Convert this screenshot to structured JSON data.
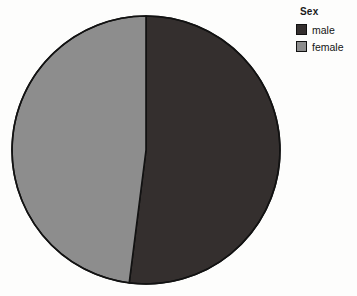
{
  "chart_data": {
    "type": "pie",
    "title": "",
    "legend_title": "Sex",
    "legend_position": "top-right",
    "categories": [
      "male",
      "female"
    ],
    "values": [
      52,
      48
    ],
    "value_unit": "percent",
    "colors": [
      "#342F2E",
      "#8D8D8D"
    ],
    "slice_border_color": "#121212",
    "start_angle_deg": 0,
    "direction": "clockwise",
    "background": "#FDFDFC",
    "grid": false,
    "labels_shown": false,
    "series": [
      {
        "name": "Sex",
        "slices": [
          {
            "label": "male",
            "value": 52,
            "color": "#342F2E",
            "angle_deg": 187
          },
          {
            "label": "female",
            "value": 48,
            "color": "#8D8D8D",
            "angle_deg": 173
          }
        ]
      }
    ],
    "geometry": {
      "center_x": 146,
      "center_y": 150,
      "radius": 135
    }
  },
  "legend": {
    "title": "Sex",
    "items": [
      {
        "label": "male",
        "color": "#342F2E"
      },
      {
        "label": "female",
        "color": "#8D8D8D"
      }
    ]
  },
  "icons": {
    "male_swatch": "square-swatch-icon",
    "female_swatch": "square-swatch-icon"
  }
}
